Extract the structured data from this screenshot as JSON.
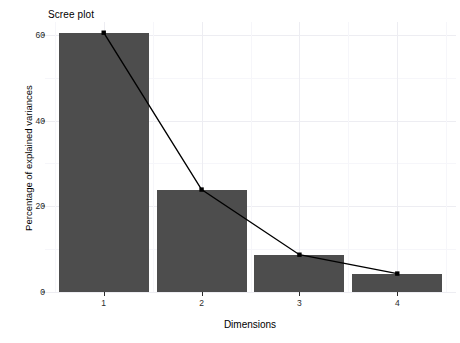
{
  "chart_data": {
    "type": "bar",
    "title": "Scree plot",
    "xlabel": "Dimensions",
    "ylabel": "Percentage of explained variances",
    "categories": [
      "1",
      "2",
      "3",
      "4"
    ],
    "values": [
      60.5,
      23.9,
      8.7,
      4.3
    ],
    "series": [
      {
        "name": "Percentage of explained variances",
        "values": [
          60.5,
          23.9,
          8.7,
          4.3
        ]
      }
    ],
    "overlay": {
      "type": "line",
      "name": "Percentage of explained variances",
      "x": [
        "1",
        "2",
        "3",
        "4"
      ],
      "values": [
        60.5,
        23.9,
        8.7,
        4.3
      ],
      "marker": "point",
      "color": "#000000"
    },
    "xlim": [
      0.4,
      4.6
    ],
    "ylim": [
      0,
      63
    ],
    "yticks": [
      0,
      20,
      40,
      60
    ],
    "ytick_labels": [
      "0",
      "20",
      "40",
      "60"
    ],
    "xticks": [
      "1",
      "2",
      "3",
      "4"
    ],
    "grid": true,
    "grid_major_color": "#ededf2",
    "grid_minor_color": "#f6f6fa",
    "legend": "none",
    "bar_color": "#4d4d4d",
    "panel_background": "#ffffff"
  }
}
